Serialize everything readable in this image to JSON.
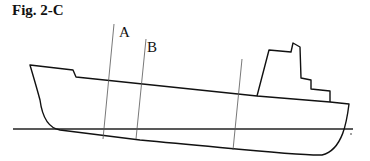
{
  "figure": {
    "title": "Fig. 2-C",
    "section_labels": {
      "a": "A",
      "b": "B"
    },
    "colors": {
      "outline": "#111111",
      "section_line": "#555555",
      "waterline": "#222222"
    }
  }
}
